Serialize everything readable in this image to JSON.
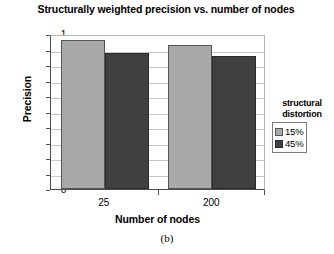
{
  "chart_data": {
    "type": "bar",
    "title": "Structurally weighted precision vs. number of nodes",
    "xlabel": "Number of nodes",
    "ylabel": "Precision",
    "categories": [
      "25",
      "200"
    ],
    "series": [
      {
        "name": "15%",
        "values": [
          0.96,
          0.93
        ],
        "color": "#a9a9a9"
      },
      {
        "name": "45%",
        "values": [
          0.88,
          0.86
        ],
        "color": "#404040"
      }
    ],
    "ylim": [
      0,
      1
    ],
    "yticks": [
      "1",
      "0.9",
      "0.8",
      "0.7",
      "0.6",
      "0.5",
      "0.4",
      "0.3",
      "0.2",
      "0.1",
      "0"
    ],
    "grid": true,
    "legend": {
      "title_line1": "structural",
      "title_line2": "distortion",
      "position": "right"
    }
  },
  "caption": "(b)"
}
